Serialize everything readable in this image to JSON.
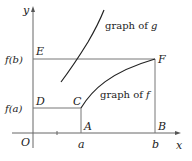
{
  "diagram": {
    "axes": {
      "x_label": "x",
      "y_label": "y",
      "origin_label": "O",
      "x_ticks": [
        "a",
        "b"
      ],
      "y_ticks": [
        "f(a)",
        "f(b)"
      ]
    },
    "points": {
      "A": "A",
      "B": "B",
      "C": "C",
      "D": "D",
      "E": "E",
      "F": "F"
    },
    "curves": {
      "g_label": "graph of g",
      "g_label_prefix": "graph of ",
      "g_label_var": "g",
      "f_label_prefix": "graph of ",
      "f_label_var": "f"
    },
    "colors": {
      "line": "#555555",
      "curve": "#222222",
      "text": "#222222"
    }
  }
}
